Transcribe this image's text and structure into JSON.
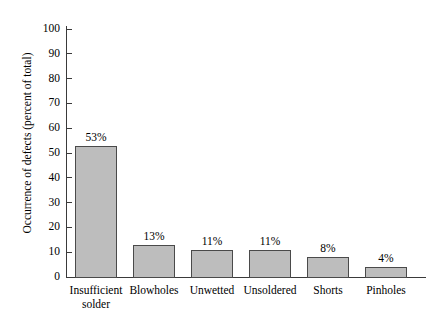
{
  "chart_data": {
    "type": "bar",
    "title": "",
    "xlabel": "",
    "ylabel": "Occurrence of defects (percent of total)",
    "ylim": [
      0,
      100
    ],
    "ytick_step": 10,
    "yticks": [
      "100",
      "90",
      "80",
      "70",
      "60",
      "50",
      "40",
      "30",
      "20",
      "10",
      "0"
    ],
    "grid": false,
    "legend": null,
    "categories": [
      "Insufficient solder",
      "Blowholes",
      "Unwetted",
      "Unsoldered",
      "Shorts",
      "Pinholes"
    ],
    "category_lines": [
      [
        "Insufficient",
        "solder"
      ],
      [
        "Blowholes"
      ],
      [
        "Unwetted"
      ],
      [
        "Unsoldered"
      ],
      [
        "Shorts"
      ],
      [
        "Pinholes"
      ]
    ],
    "values": [
      53,
      13,
      11,
      11,
      8,
      4
    ],
    "data_labels": [
      "53%",
      "13%",
      "11%",
      "11%",
      "8%",
      "4%"
    ],
    "colors": {
      "bar_fill": "#bdbdbd",
      "bar_stroke": "#4a4a4a",
      "axis": "#3a3a3a",
      "text": "#000000",
      "background": "#ffffff"
    }
  }
}
